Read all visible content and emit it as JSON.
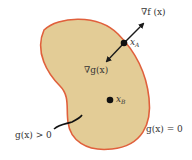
{
  "diagram": {
    "colors": {
      "region_fill": "#e3cc96",
      "region_border": "#e0603c",
      "ink": "#1a1a1a",
      "background": "#ffffff"
    },
    "labels": {
      "grad_f": "∇f (x)",
      "grad_g": "∇g(x)",
      "point_a_main": "x",
      "point_a_sub": "A",
      "point_b_main": "x",
      "point_b_sub": "B",
      "inside": "g(x) > 0",
      "boundary": "g(x) = 0"
    }
  }
}
